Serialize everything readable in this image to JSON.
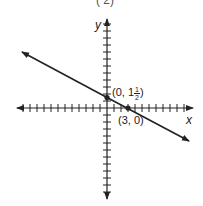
{
  "figure": {
    "clipped_top_text": "(   2)",
    "axes": {
      "x_label": "x",
      "y_label": "y",
      "x_range": [
        -13,
        12
      ],
      "y_range": [
        -13,
        12
      ],
      "tick_spacing": 1
    },
    "points": [
      {
        "label_prefix": "(0, 1",
        "label_num": "1",
        "label_den": "2",
        "label_suffix": ")",
        "x": 0,
        "y": 1.5
      },
      {
        "label": "(3, 0)",
        "x": 3,
        "y": 0
      }
    ],
    "line": {
      "slope": -0.5,
      "y_intercept": 1.5,
      "x_intercept": 3,
      "arrows": "both"
    },
    "colors": {
      "ink": "#222222",
      "background": "#ffffff"
    }
  }
}
